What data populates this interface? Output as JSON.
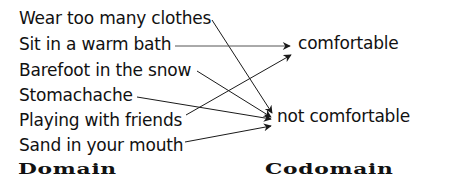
{
  "diagram": {
    "type": "function-mapping",
    "domain": {
      "heading": "Domain",
      "items": [
        "Wear too many clothes",
        "Sit in a warm bath",
        "Barefoot in the snow",
        "Stomachache",
        "Playing with friends",
        "Sand in your mouth"
      ]
    },
    "codomain": {
      "heading": "Codomain",
      "items": [
        "comfortable",
        "not comfortable"
      ]
    },
    "mappings": [
      {
        "from": "Wear too many clothes",
        "to": "not comfortable"
      },
      {
        "from": "Sit in a warm bath",
        "to": "comfortable"
      },
      {
        "from": "Barefoot in the snow",
        "to": "not comfortable"
      },
      {
        "from": "Stomachache",
        "to": "not comfortable"
      },
      {
        "from": "Playing with friends",
        "to": "comfortable"
      },
      {
        "from": "Sand in your mouth",
        "to": "not comfortable"
      }
    ],
    "colors": {
      "text": "#111111",
      "arrow": "#1a1a1a",
      "background": "#ffffff"
    }
  }
}
